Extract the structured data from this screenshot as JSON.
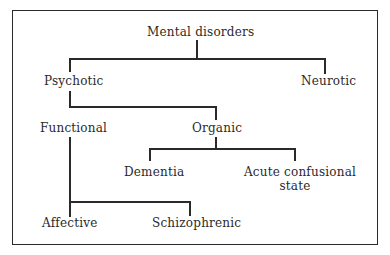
{
  "diagram": {
    "type": "tree",
    "root": {
      "label": "Mental disorders",
      "children": [
        {
          "label": "Psychotic",
          "children": [
            {
              "label": "Functional",
              "children": [
                {
                  "label": "Affective"
                },
                {
                  "label": "Schizophrenic"
                }
              ]
            },
            {
              "label": "Organic",
              "children": [
                {
                  "label": "Dementia"
                },
                {
                  "label": "Acute confusional state"
                }
              ]
            }
          ]
        },
        {
          "label": "Neurotic"
        }
      ]
    },
    "nodes": {
      "mental_disorders": "Mental disorders",
      "psychotic": "Psychotic",
      "neurotic": "Neurotic",
      "functional": "Functional",
      "organic": "Organic",
      "dementia": "Dementia",
      "acute_confusional_line1": "Acute confusional",
      "acute_confusional_line2": "state",
      "affective": "Affective",
      "schizophrenic": "Schizophrenic"
    },
    "colors": {
      "line": "#2a2a2a",
      "text": "#2a2a2a",
      "background": "#ffffff"
    }
  }
}
